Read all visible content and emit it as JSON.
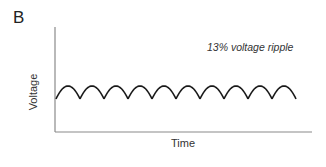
{
  "panel_label": "B",
  "chart_data": {
    "type": "line",
    "title": "",
    "annotation": "13% voltage ripple",
    "xlabel": "Time",
    "ylabel": "Voltage",
    "waveform": "full-wave rectified sine (ripple)",
    "series": [
      {
        "name": "Voltage",
        "cycles": 10,
        "ripple_percent": 13,
        "peak": 1.0,
        "trough": 0.87
      }
    ],
    "x_ticks": [],
    "y_ticks": [],
    "grid": false,
    "legend": "none",
    "colors": {
      "line": "#1a1a1a",
      "axis": "#8a8a8a"
    }
  }
}
